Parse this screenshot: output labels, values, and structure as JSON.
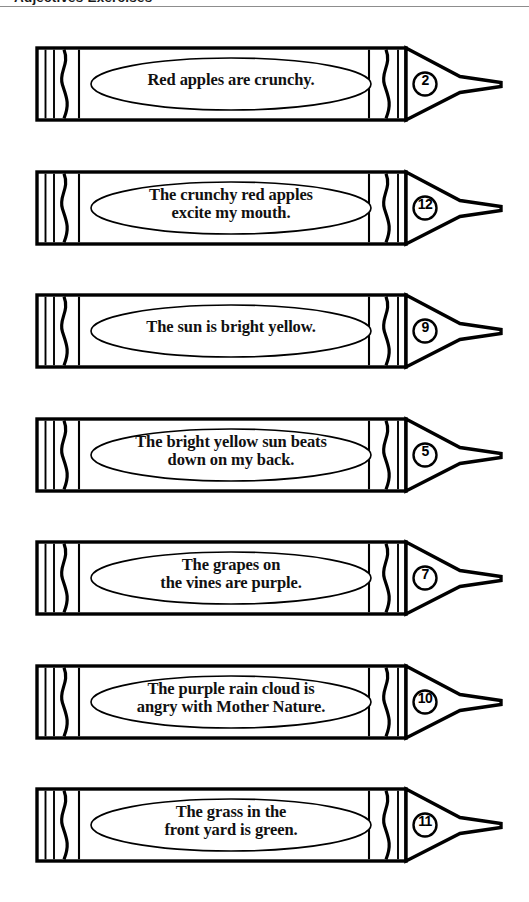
{
  "header": {
    "title": "Adjectives Exercises",
    "rule_color": "#8d8d8d"
  },
  "worksheet": {
    "ink_color": "#000000",
    "paper_color": "#ffffff",
    "item_count": 7
  },
  "crayons": [
    {
      "number": "2",
      "sentence": "Red apples are crunchy.",
      "lines": 1
    },
    {
      "number": "12",
      "sentence": "The crunchy red apples\nexcite my mouth.",
      "lines": 2
    },
    {
      "number": "9",
      "sentence": "The sun is bright yellow.",
      "lines": 1
    },
    {
      "number": "5",
      "sentence": "The bright yellow sun beats\ndown on my back.",
      "lines": 2
    },
    {
      "number": "7",
      "sentence": "The grapes on\nthe vines are purple.",
      "lines": 2
    },
    {
      "number": "10",
      "sentence": "The purple rain cloud is\nangry with Mother Nature.",
      "lines": 2
    },
    {
      "number": "11",
      "sentence": "The grass in the\nfront yard is green.",
      "lines": 2
    }
  ]
}
